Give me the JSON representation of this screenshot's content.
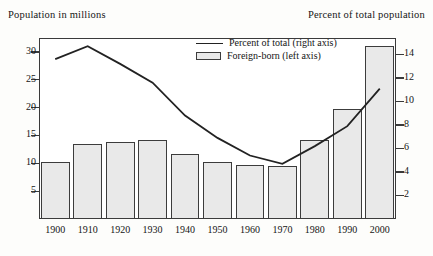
{
  "titles": {
    "left_axis": "Population in millions",
    "right_axis": "Percent of total population"
  },
  "legend": {
    "items": [
      {
        "label": "Percent of total (right axis)",
        "marker": "line",
        "color": "#222222"
      },
      {
        "label": "Foreign-born (left axis)",
        "marker": "swatch",
        "color": "#e9e9e9"
      }
    ]
  },
  "chart_data": {
    "type": "bar",
    "title": "",
    "subtitle": "",
    "xlabel": "",
    "ylabel": "Population in millions",
    "y2label": "Percent of total population",
    "categories": [
      "1900",
      "1910",
      "1920",
      "1930",
      "1940",
      "1950",
      "1960",
      "1970",
      "1980",
      "1990",
      "2000"
    ],
    "ylim": [
      0,
      32.5
    ],
    "y2lim": [
      0,
      15.4
    ],
    "yticks": [
      5,
      10,
      15,
      20,
      25,
      30
    ],
    "y2ticks": [
      2,
      4,
      6,
      8,
      10,
      12,
      14
    ],
    "grid": false,
    "legend_position": "top-center",
    "series": [
      {
        "name": "Foreign-born (left axis)",
        "type": "bar",
        "axis": "left",
        "unit": "millions",
        "color": "#e9e9e9",
        "edge_color": "#3c3c3c",
        "values": [
          10.3,
          13.5,
          13.9,
          14.2,
          11.6,
          10.3,
          9.7,
          9.6,
          14.1,
          19.8,
          31.1
        ]
      },
      {
        "name": "Percent of total (right axis)",
        "type": "line",
        "axis": "right",
        "unit": "percent",
        "color": "#222222",
        "values": [
          13.6,
          14.7,
          13.2,
          11.6,
          8.8,
          6.9,
          5.4,
          4.7,
          6.2,
          7.9,
          11.1
        ]
      }
    ]
  }
}
